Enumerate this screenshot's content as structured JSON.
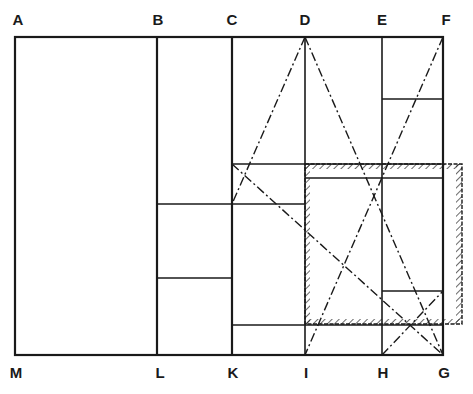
{
  "diagram": {
    "colors": {
      "ink": "#1a1a1a",
      "background": "#ffffff"
    },
    "labels": {
      "A": "A",
      "B": "B",
      "C": "C",
      "D": "D",
      "E": "E",
      "F": "F",
      "G": "G",
      "H": "H",
      "I": "I",
      "K": "K",
      "L": "L",
      "M": "M"
    },
    "points": {
      "A": [
        15,
        37
      ],
      "B": [
        157,
        37
      ],
      "C": [
        232,
        37
      ],
      "D": [
        305,
        37
      ],
      "E": [
        382,
        37
      ],
      "F": [
        443,
        37
      ],
      "M": [
        15,
        355
      ],
      "L": [
        157,
        355
      ],
      "K": [
        232,
        355
      ],
      "I": [
        305,
        355
      ],
      "H": [
        382,
        355
      ],
      "G": [
        443,
        355
      ]
    },
    "hatched_rectangle": {
      "x": 305,
      "y": 164,
      "width": 157,
      "height": 160
    },
    "dash_dot_lines": [
      {
        "from": "D",
        "to": "G"
      },
      {
        "from": "D",
        "to": [
          232,
          204
        ]
      },
      {
        "from": "F",
        "to": "I"
      },
      {
        "from": [
          232,
          164
        ],
        "to": "G"
      },
      {
        "from": "H",
        "to": [
          443,
          291
        ]
      }
    ]
  }
}
